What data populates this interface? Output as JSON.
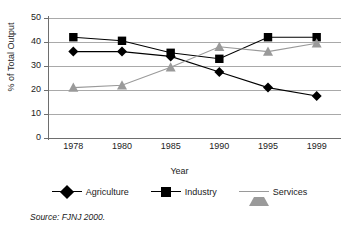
{
  "chart_data": {
    "type": "line",
    "title": "",
    "xlabel": "Year",
    "ylabel": "% of Total Output",
    "categories": [
      "1978",
      "1980",
      "1985",
      "1990",
      "1995",
      "1999"
    ],
    "ylim": [
      0,
      50
    ],
    "yticks": [
      0,
      10,
      20,
      30,
      40,
      50
    ],
    "ytick_labels": [
      "0",
      "10",
      "20",
      "30",
      "40",
      "50"
    ],
    "grid": true,
    "legend_position": "bottom",
    "series": [
      {
        "name": "Agriculture",
        "marker": "diamond",
        "color": "#000000",
        "values": [
          36.0,
          36.0,
          34.0,
          27.5,
          21.0,
          17.5
        ]
      },
      {
        "name": "Industry",
        "marker": "square",
        "color": "#000000",
        "values": [
          42.0,
          40.5,
          35.5,
          33.0,
          42.0,
          42.0
        ]
      },
      {
        "name": "Services",
        "marker": "triangle",
        "color": "#9a9a9a",
        "values": [
          21.0,
          22.0,
          29.5,
          38.0,
          36.0,
          39.5
        ]
      }
    ]
  },
  "source": {
    "prefix": "Source:",
    "text": "FJNJ 2000."
  },
  "colors": {
    "agriculture": "#000000",
    "industry": "#000000",
    "services": "#9a9a9a",
    "gridline": "#a9a9a9",
    "axis": "#6e6e6e",
    "background": "#ffffff"
  }
}
